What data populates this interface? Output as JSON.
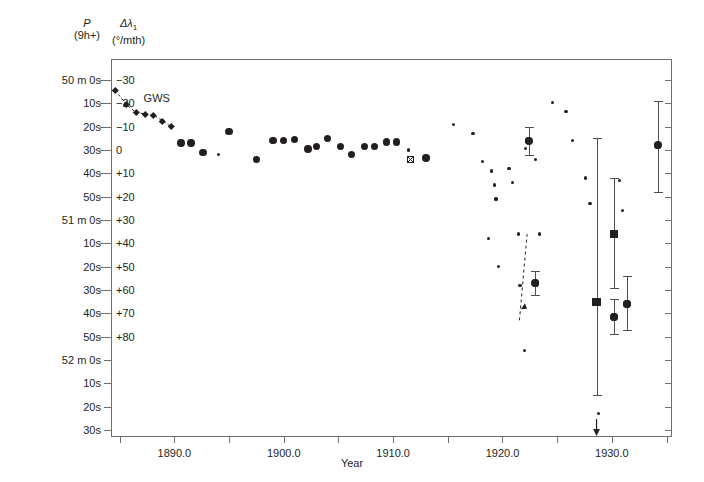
{
  "axes": {
    "header_left_line1": "P",
    "header_left_line2": "(9h+)",
    "header_right_line1": "Δλ",
    "header_right_sub": "1",
    "header_right_line2": "(°/mth)",
    "xlabel": "Year",
    "x_ticks": [
      1885,
      1890,
      1895,
      1900,
      1905,
      1910,
      1915,
      1920,
      1925,
      1930,
      1935
    ],
    "x_tick_labels": [
      "",
      "1890.0",
      "",
      "1900.0",
      "",
      "1910.0",
      "",
      "1920.0",
      "",
      "1930.0",
      ""
    ],
    "xlim": [
      1884.2,
      1935.5
    ],
    "y_left_labels": [
      "50 m  0s",
      "10s",
      "20s",
      "30s",
      "40s",
      "50s",
      "51 m  0s",
      "10s",
      "20s",
      "30s",
      "40s",
      "50s",
      "52 m  0s",
      "10s",
      "20s",
      "30s"
    ],
    "y_left_values": [
      0,
      10,
      20,
      30,
      40,
      50,
      60,
      70,
      80,
      90,
      100,
      110,
      120,
      130,
      140,
      150
    ],
    "y_right_labels": [
      "−30",
      "−20",
      "−10",
      "0",
      "+10",
      "+20",
      "+30",
      "+40",
      "+50",
      "+60",
      "+70",
      "+80"
    ],
    "y_right_values": [
      -30,
      -20,
      -10,
      0,
      10,
      20,
      30,
      40,
      50,
      60,
      70,
      80
    ],
    "ylim_seconds": [
      -9,
      153
    ],
    "series_label_gws": "GWS",
    "accent_color": "#231f20",
    "frame_color": "#6f6f6f"
  },
  "chart_data": {
    "type": "scatter",
    "title": "",
    "xlabel": "Year",
    "ylabel": "P (9h+) / Δλ₁ (°/mth)",
    "xlim": [
      1884.2,
      1935.5
    ],
    "ylim": [
      -9,
      153
    ],
    "grid": false,
    "legend": "none",
    "annotations": [
      {
        "text": "GWS",
        "x": 1887.0,
        "y": 8.0
      },
      {
        "text": "downward-arrow",
        "x": 1928.6,
        "y": 150.0
      },
      {
        "text": "upward-dashed-arrow",
        "x": 1921.9,
        "y": 72.0
      }
    ],
    "series": [
      {
        "name": "GWS",
        "marker": "diamond",
        "line": "dashed",
        "points": [
          {
            "x": 1884.6,
            "y": 4.5
          },
          {
            "x": 1885.6,
            "y": 10.5
          },
          {
            "x": 1886.5,
            "y": 14.0
          },
          {
            "x": 1887.3,
            "y": 14.5
          },
          {
            "x": 1888.1,
            "y": 15.0
          },
          {
            "x": 1888.9,
            "y": 17.5
          },
          {
            "x": 1889.7,
            "y": 20.0
          }
        ]
      },
      {
        "name": "main-observations",
        "marker": "circle-large",
        "line": "none",
        "points": [
          {
            "x": 1890.6,
            "y": 27.0
          },
          {
            "x": 1891.5,
            "y": 27.0
          },
          {
            "x": 1892.6,
            "y": 31.0
          },
          {
            "x": 1895.0,
            "y": 22.0
          },
          {
            "x": 1897.5,
            "y": 34.0
          },
          {
            "x": 1899.0,
            "y": 26.0
          },
          {
            "x": 1900.0,
            "y": 26.0
          },
          {
            "x": 1901.0,
            "y": 25.5
          },
          {
            "x": 1902.2,
            "y": 29.5
          },
          {
            "x": 1903.0,
            "y": 28.5
          },
          {
            "x": 1904.0,
            "y": 25.0
          },
          {
            "x": 1905.2,
            "y": 28.5
          },
          {
            "x": 1906.2,
            "y": 32.0
          },
          {
            "x": 1907.4,
            "y": 28.5
          },
          {
            "x": 1908.3,
            "y": 28.5
          },
          {
            "x": 1909.4,
            "y": 26.5
          },
          {
            "x": 1910.3,
            "y": 26.5
          },
          {
            "x": 1913.0,
            "y": 33.5
          },
          {
            "x": 1922.4,
            "y": 26.0
          },
          {
            "x": 1923.0,
            "y": 87.0
          },
          {
            "x": 1930.2,
            "y": 101.5
          },
          {
            "x": 1931.4,
            "y": 96.0
          },
          {
            "x": 1934.2,
            "y": 28.0
          }
        ]
      },
      {
        "name": "small-observations",
        "marker": "dot-small",
        "line": "none",
        "points": [
          {
            "x": 1894.0,
            "y": 32.0
          },
          {
            "x": 1911.4,
            "y": 30.0
          },
          {
            "x": 1915.5,
            "y": 19.0
          },
          {
            "x": 1917.3,
            "y": 23.0
          },
          {
            "x": 1918.2,
            "y": 35.0
          },
          {
            "x": 1919.0,
            "y": 39.0
          },
          {
            "x": 1919.3,
            "y": 45.0
          },
          {
            "x": 1918.7,
            "y": 68.0
          },
          {
            "x": 1919.4,
            "y": 51.0
          },
          {
            "x": 1919.6,
            "y": 80.0
          },
          {
            "x": 1920.6,
            "y": 38.0
          },
          {
            "x": 1920.9,
            "y": 44.0
          },
          {
            "x": 1921.5,
            "y": 66.0
          },
          {
            "x": 1921.6,
            "y": 88.0
          },
          {
            "x": 1922.1,
            "y": 29.5
          },
          {
            "x": 1922.0,
            "y": 116.0
          },
          {
            "x": 1923.0,
            "y": 34.0
          },
          {
            "x": 1923.4,
            "y": 66.0
          },
          {
            "x": 1924.6,
            "y": 9.5
          },
          {
            "x": 1925.8,
            "y": 13.5
          },
          {
            "x": 1926.4,
            "y": 26.0
          },
          {
            "x": 1927.6,
            "y": 42.0
          },
          {
            "x": 1928.0,
            "y": 53.0
          },
          {
            "x": 1928.8,
            "y": 143.0
          },
          {
            "x": 1930.7,
            "y": 43.0
          },
          {
            "x": 1931.0,
            "y": 56.0
          }
        ]
      },
      {
        "name": "square-with-errorbar",
        "marker": "square",
        "line": "none",
        "points": [
          {
            "x": 1928.6,
            "y": 95.0,
            "yerr_low": 135.0,
            "yerr_high": 25.0
          },
          {
            "x": 1930.2,
            "y": 66.0,
            "yerr_low": 89.0,
            "yerr_high": 42.0
          }
        ]
      },
      {
        "name": "circle-with-errorbar",
        "marker": "circle-large",
        "line": "none",
        "points": [
          {
            "x": 1922.4,
            "y": 26.0,
            "yerr_low": 32.0,
            "yerr_high": 20.0
          },
          {
            "x": 1923.0,
            "y": 87.0,
            "yerr_low": 92.0,
            "yerr_high": 82.0
          },
          {
            "x": 1930.2,
            "y": 101.5,
            "yerr_low": 109.0,
            "yerr_high": 94.0
          },
          {
            "x": 1931.4,
            "y": 96.0,
            "yerr_low": 107.0,
            "yerr_high": 84.0
          },
          {
            "x": 1934.2,
            "y": 28.0,
            "yerr_low": 48.0,
            "yerr_high": 9.0
          }
        ]
      },
      {
        "name": "crossed-square-marker",
        "marker": "crossed-square",
        "line": "none",
        "points": [
          {
            "x": 1911.6,
            "y": 34.0
          }
        ]
      }
    ]
  }
}
